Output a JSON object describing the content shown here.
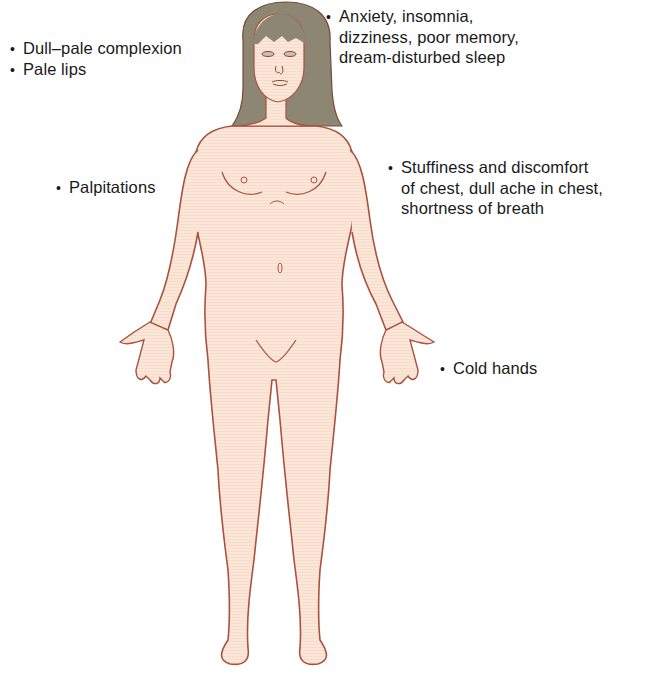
{
  "diagram": {
    "type": "anatomical-symptom-map",
    "colors": {
      "skin": "#fbe6d8",
      "outline": "#a8533f",
      "hair": "#8c8672",
      "text": "#1a1a1a",
      "background": "#ffffff"
    }
  },
  "labels": {
    "face": {
      "lines": [
        "Dull–pale complexion",
        "Pale lips"
      ]
    },
    "head": {
      "lines": [
        "Anxiety, insomnia,",
        "dizziness, poor memory,",
        "dream-disturbed sleep"
      ]
    },
    "heart": {
      "lines": [
        "Palpitations"
      ]
    },
    "chest": {
      "lines": [
        "Stuffiness and discomfort",
        "of chest, dull ache in chest,",
        "shortness of breath"
      ]
    },
    "hands": {
      "lines": [
        "Cold hands"
      ]
    },
    "bullet": "•"
  }
}
